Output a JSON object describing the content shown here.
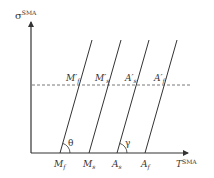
{
  "diagram": {
    "y_axis": {
      "symbol": "σ",
      "superscript": "SMA"
    },
    "x_axis": {
      "symbol": "T",
      "superscript": "SMA"
    },
    "bottom_labels": [
      {
        "main": "M",
        "sub": "f"
      },
      {
        "main": "M",
        "sub": "s"
      },
      {
        "main": "A",
        "sub": "s"
      },
      {
        "main": "A",
        "sub": "f"
      }
    ],
    "top_labels": [
      {
        "main": "M′",
        "sub": "f"
      },
      {
        "main": "M′",
        "sub": "s"
      },
      {
        "main": "A′",
        "sub": "s"
      },
      {
        "main": "A′",
        "sub": "f"
      }
    ],
    "angles": {
      "theta": "θ",
      "gamma": "γ"
    },
    "colors": {
      "line": "#333333",
      "dashed": "#555555"
    }
  }
}
